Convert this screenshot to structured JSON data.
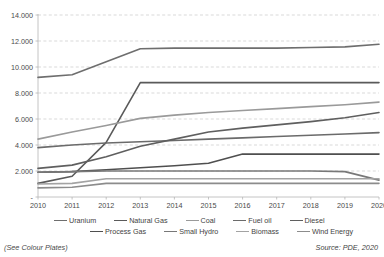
{
  "figure": {
    "note_left": "(See Colour Plates)",
    "note_right": "Source: PDE, 2020"
  },
  "chart_data": {
    "type": "line",
    "title": "",
    "xlabel": "",
    "ylabel": "",
    "grid": true,
    "legend_position": "bottom",
    "ylim": [
      0,
      14000
    ],
    "ytick_labels": [
      "14.000",
      "12.000",
      "10.000",
      "8.000",
      "6.000",
      "4.000",
      "2.000",
      "-"
    ],
    "ytick_values": [
      14000,
      12000,
      10000,
      8000,
      6000,
      4000,
      2000,
      0
    ],
    "categories": [
      "2010",
      "2011",
      "2012",
      "2013",
      "2014",
      "2015",
      "2016",
      "2017",
      "2018",
      "2019",
      "2020"
    ],
    "x": [
      2010,
      2011,
      2012,
      2013,
      2014,
      2015,
      2016,
      2017,
      2018,
      2019,
      2020
    ],
    "series": [
      {
        "name": "Uranium",
        "color": "#6e6e6e",
        "width": 1.6,
        "values": [
          9200,
          9400,
          10400,
          11400,
          11450,
          11450,
          11450,
          11450,
          11500,
          11550,
          11750
        ]
      },
      {
        "name": "Natural Gas",
        "color": "#5a5a5a",
        "width": 1.6,
        "values": [
          1050,
          1600,
          4200,
          8800,
          8800,
          8800,
          8800,
          8800,
          8800,
          8800,
          8800
        ]
      },
      {
        "name": "Coal",
        "color": "#9a9a9a",
        "width": 1.6,
        "values": [
          4450,
          5000,
          5500,
          6050,
          6300,
          6500,
          6650,
          6800,
          6950,
          7100,
          7300
        ]
      },
      {
        "name": "Fuel oil",
        "color": "#6b6b6b",
        "width": 1.6,
        "values": [
          3800,
          4000,
          4150,
          4250,
          4350,
          4450,
          4550,
          4650,
          4750,
          4850,
          4950
        ]
      },
      {
        "name": "Diesel",
        "color": "#5f5f5f",
        "width": 1.6,
        "values": [
          2200,
          2450,
          3100,
          3900,
          4450,
          5000,
          5300,
          5550,
          5800,
          6100,
          6500
        ]
      },
      {
        "name": "Process Gas",
        "color": "#4f4f4f",
        "width": 1.6,
        "values": [
          1900,
          1950,
          2100,
          2250,
          2400,
          2600,
          3300,
          3300,
          3300,
          3300,
          3300
        ]
      },
      {
        "name": "Small Hydro",
        "color": "#787878",
        "width": 1.6,
        "values": [
          1900,
          1950,
          2000,
          2000,
          2000,
          2000,
          2000,
          2000,
          2000,
          1950,
          1300
        ]
      },
      {
        "name": "Biomass",
        "color": "#a3a3a3",
        "width": 1.6,
        "values": [
          1000,
          1050,
          1400,
          1400,
          1400,
          1400,
          1400,
          1400,
          1400,
          1400,
          1400
        ]
      },
      {
        "name": "Wind Energy",
        "color": "#8c8c8c",
        "width": 1.6,
        "values": [
          700,
          750,
          1050,
          1050,
          1050,
          1050,
          1050,
          1050,
          1050,
          1050,
          1050
        ]
      }
    ]
  },
  "axes": {
    "grid_color": "#c9c9c9",
    "axis_color": "#b5b5b5"
  }
}
